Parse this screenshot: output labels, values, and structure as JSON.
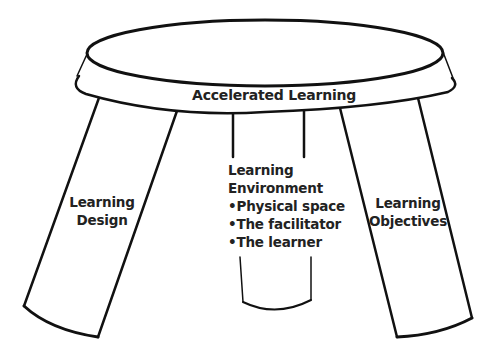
{
  "diagram": {
    "title": "Accelerated Learning",
    "legs": [
      {
        "label_lines": [
          "Learning",
          "Design"
        ]
      },
      {
        "label_lines": [
          "Learning",
          "Environment"
        ],
        "bullets": [
          "Physical space",
          "The facilitator",
          "The learner"
        ]
      },
      {
        "label_lines": [
          "Learning",
          "Objectives"
        ]
      }
    ],
    "bullet_glyph": "•",
    "colors": {
      "stroke": "#111111",
      "text": "#222222",
      "background": "#ffffff"
    }
  }
}
